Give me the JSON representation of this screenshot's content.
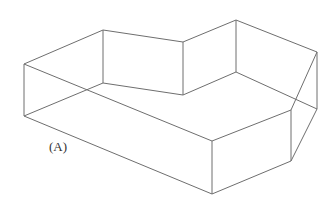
{
  "figure": {
    "type": "wireframe-prism",
    "panel_label": "(A)",
    "label_position": {
      "x": 49,
      "y": 140
    },
    "stroke_color": "#6e6e6e",
    "background": "#ffffff",
    "vertices": {
      "top_left": [
        24,
        64
      ],
      "top_back_left": [
        103,
        30
      ],
      "top_notch": [
        183,
        42
      ],
      "top_peak": [
        236,
        20
      ],
      "top_right_back": [
        317,
        52
      ],
      "top_right_front": [
        291,
        110
      ],
      "top_front": [
        212,
        141
      ],
      "bottom_left": [
        24,
        116
      ],
      "bottom_back_left": [
        103,
        83
      ],
      "bottom_notch": [
        183,
        95
      ],
      "bottom_peak": [
        236,
        72
      ],
      "bottom_right_back": [
        317,
        109
      ],
      "bottom_right_front": [
        291,
        161
      ],
      "bottom_front": [
        212,
        194
      ]
    },
    "edges": [
      [
        "top_left",
        "top_back_left"
      ],
      [
        "top_back_left",
        "top_notch"
      ],
      [
        "top_notch",
        "top_peak"
      ],
      [
        "top_peak",
        "top_right_back"
      ],
      [
        "top_right_back",
        "top_right_front"
      ],
      [
        "top_right_front",
        "top_front"
      ],
      [
        "top_front",
        "top_left"
      ],
      [
        "bottom_left",
        "bottom_back_left"
      ],
      [
        "bottom_back_left",
        "bottom_notch"
      ],
      [
        "bottom_notch",
        "bottom_peak"
      ],
      [
        "bottom_peak",
        "bottom_right_back"
      ],
      [
        "bottom_right_back",
        "bottom_right_front"
      ],
      [
        "bottom_right_front",
        "bottom_front"
      ],
      [
        "bottom_front",
        "bottom_left"
      ],
      [
        "top_left",
        "bottom_left"
      ],
      [
        "top_back_left",
        "bottom_back_left"
      ],
      [
        "top_notch",
        "bottom_notch"
      ],
      [
        "top_peak",
        "bottom_peak"
      ],
      [
        "top_right_back",
        "bottom_right_back"
      ],
      [
        "top_right_front",
        "bottom_right_front"
      ],
      [
        "top_front",
        "bottom_front"
      ]
    ]
  }
}
